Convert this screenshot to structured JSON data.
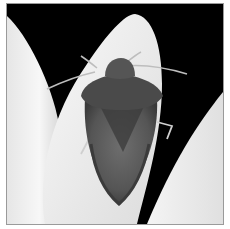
{
  "image": {
    "subject": "shield bug on white flower petals",
    "style": "grayscale photograph",
    "alt": "Grayscale close-up photo of a shield bug resting on white flower petals against a black background"
  },
  "colors": {
    "background": "#000000",
    "petal": "#f2f2f2",
    "petal_shadow": "#cfcfcf",
    "bug_body": "#5a5a5a",
    "bug_dark": "#2e2e2e",
    "border": "#9a9a9a"
  }
}
